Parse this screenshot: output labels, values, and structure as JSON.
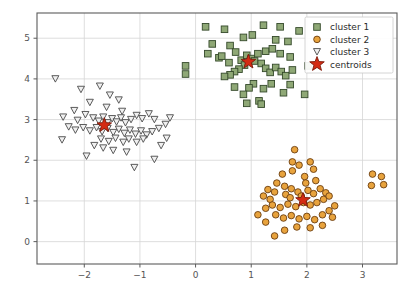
{
  "chart_data": {
    "type": "scatter",
    "title": "",
    "xlabel": "",
    "ylabel": "",
    "xlim": [
      -2.85,
      3.62
    ],
    "ylim": [
      -0.55,
      5.62
    ],
    "xticks": [
      -2,
      -1,
      0,
      1,
      2,
      3
    ],
    "yticks": [
      0,
      1,
      2,
      3,
      4,
      5
    ],
    "xticklabels": [
      "−2",
      "−1",
      "0",
      "1",
      "2",
      "3"
    ],
    "yticklabels": [
      "0",
      "1",
      "2",
      "3",
      "4",
      "5"
    ],
    "grid": true,
    "legend_position": "upper right",
    "colors": {
      "cluster1_fill": "#8fa876",
      "cluster1_edge": "#34492a",
      "cluster2_fill": "#e8a33d",
      "cluster2_edge": "#6b3d10",
      "cluster3_fill": "#f0f0f0",
      "cluster3_edge": "#4a4a4a",
      "centroid_fill": "#d42b13",
      "centroid_edge": "#7a1a0a",
      "grid": "#d6d6d6",
      "frame": "#5b5b5b",
      "background": "#ffffff"
    },
    "series": [
      {
        "name": "cluster 1",
        "marker": "square",
        "fill": "#8fa876",
        "edge": "#34492a",
        "points": [
          [
            -0.18,
            4.32
          ],
          [
            -0.18,
            4.12
          ],
          [
            0.18,
            5.28
          ],
          [
            0.52,
            5.22
          ],
          [
            0.3,
            4.86
          ],
          [
            0.62,
            4.82
          ],
          [
            0.86,
            5.02
          ],
          [
            1.02,
            5.08
          ],
          [
            1.22,
            5.32
          ],
          [
            1.52,
            5.28
          ],
          [
            1.86,
            5.18
          ],
          [
            1.66,
            4.92
          ],
          [
            0.22,
            4.62
          ],
          [
            0.42,
            4.52
          ],
          [
            0.47,
            4.56
          ],
          [
            0.6,
            4.4
          ],
          [
            0.72,
            4.66
          ],
          [
            0.82,
            4.46
          ],
          [
            0.92,
            4.58
          ],
          [
            1.0,
            4.5
          ],
          [
            1.06,
            4.44
          ],
          [
            1.12,
            4.62
          ],
          [
            1.18,
            4.38
          ],
          [
            0.88,
            4.34
          ],
          [
            0.78,
            4.24
          ],
          [
            0.7,
            4.18
          ],
          [
            0.62,
            4.1
          ],
          [
            0.52,
            4.06
          ],
          [
            1.26,
            4.26
          ],
          [
            1.34,
            4.16
          ],
          [
            1.44,
            4.28
          ],
          [
            1.54,
            4.18
          ],
          [
            1.62,
            4.08
          ],
          [
            1.74,
            4.22
          ],
          [
            1.26,
            4.68
          ],
          [
            1.38,
            4.74
          ],
          [
            1.52,
            4.62
          ],
          [
            1.7,
            4.54
          ],
          [
            1.44,
            4.96
          ],
          [
            1.04,
            3.88
          ],
          [
            0.96,
            3.78
          ],
          [
            0.7,
            3.8
          ],
          [
            0.86,
            3.62
          ],
          [
            1.22,
            3.76
          ],
          [
            1.36,
            3.88
          ],
          [
            1.58,
            3.66
          ],
          [
            2.02,
            4.32
          ],
          [
            1.96,
            3.62
          ],
          [
            0.92,
            3.4
          ],
          [
            1.14,
            3.46
          ],
          [
            1.18,
            3.38
          ],
          [
            1.7,
            3.86
          ]
        ]
      },
      {
        "name": "cluster 2",
        "marker": "circle",
        "fill": "#e8a33d",
        "edge": "#6b3d10",
        "points": [
          [
            1.56,
            1.66
          ],
          [
            1.74,
            1.74
          ],
          [
            1.96,
            1.6
          ],
          [
            2.12,
            1.78
          ],
          [
            1.46,
            1.44
          ],
          [
            1.6,
            1.36
          ],
          [
            1.3,
            1.28
          ],
          [
            1.42,
            1.22
          ],
          [
            1.22,
            1.12
          ],
          [
            1.34,
            1.04
          ],
          [
            1.62,
            1.16
          ],
          [
            1.72,
            1.3
          ],
          [
            1.84,
            1.22
          ],
          [
            1.9,
            1.12
          ],
          [
            2.02,
            1.26
          ],
          [
            2.12,
            1.18
          ],
          [
            2.24,
            1.3
          ],
          [
            2.34,
            1.2
          ],
          [
            2.3,
            1.04
          ],
          [
            2.4,
            1.12
          ],
          [
            2.18,
            0.96
          ],
          [
            2.06,
            0.9
          ],
          [
            1.94,
            0.96
          ],
          [
            1.8,
            0.86
          ],
          [
            1.66,
            0.92
          ],
          [
            1.52,
            0.84
          ],
          [
            1.38,
            0.9
          ],
          [
            1.26,
            0.82
          ],
          [
            1.44,
            0.66
          ],
          [
            1.58,
            0.58
          ],
          [
            1.72,
            0.64
          ],
          [
            1.86,
            0.56
          ],
          [
            2.0,
            0.62
          ],
          [
            2.14,
            0.54
          ],
          [
            2.28,
            0.66
          ],
          [
            2.4,
            0.76
          ],
          [
            2.5,
            0.88
          ],
          [
            2.46,
            0.6
          ],
          [
            2.28,
            0.4
          ],
          [
            2.06,
            0.34
          ],
          [
            1.82,
            0.36
          ],
          [
            1.6,
            0.28
          ],
          [
            1.42,
            0.14
          ],
          [
            1.26,
            0.48
          ],
          [
            1.12,
            0.66
          ],
          [
            1.7,
            1.08
          ],
          [
            1.98,
            1.44
          ],
          [
            2.16,
            1.5
          ],
          [
            1.86,
            1.88
          ],
          [
            2.06,
            1.96
          ],
          [
            1.74,
            1.96
          ],
          [
            3.18,
            1.66
          ],
          [
            3.34,
            1.6
          ],
          [
            3.16,
            1.38
          ],
          [
            3.38,
            1.4
          ],
          [
            1.78,
            2.26
          ]
        ]
      },
      {
        "name": "cluster 3",
        "marker": "triangle_down",
        "fill": "#f0f0f0",
        "edge": "#4a4a4a",
        "points": [
          [
            -2.52,
            4.0
          ],
          [
            -2.06,
            3.74
          ],
          [
            -1.72,
            3.82
          ],
          [
            -1.38,
            3.48
          ],
          [
            -1.9,
            3.42
          ],
          [
            -2.18,
            3.22
          ],
          [
            -1.6,
            3.3
          ],
          [
            -1.32,
            3.2
          ],
          [
            -2.38,
            3.06
          ],
          [
            -2.12,
            2.98
          ],
          [
            -1.98,
            3.12
          ],
          [
            -1.84,
            3.04
          ],
          [
            -1.74,
            2.96
          ],
          [
            -1.66,
            3.06
          ],
          [
            -1.58,
            2.92
          ],
          [
            -1.5,
            3.02
          ],
          [
            -1.42,
            2.94
          ],
          [
            -1.34,
            3.04
          ],
          [
            -1.26,
            2.92
          ],
          [
            -1.16,
            3.0
          ],
          [
            -1.06,
            3.1
          ],
          [
            -0.96,
            3.02
          ],
          [
            -0.84,
            3.14
          ],
          [
            -0.74,
            3.0
          ],
          [
            -2.28,
            2.82
          ],
          [
            -2.16,
            2.74
          ],
          [
            -2.02,
            2.8
          ],
          [
            -1.9,
            2.72
          ],
          [
            -1.78,
            2.8
          ],
          [
            -1.68,
            2.7
          ],
          [
            -1.58,
            2.78
          ],
          [
            -1.48,
            2.68
          ],
          [
            -1.38,
            2.76
          ],
          [
            -1.28,
            2.66
          ],
          [
            -1.18,
            2.74
          ],
          [
            -1.08,
            2.64
          ],
          [
            -0.98,
            2.72
          ],
          [
            -0.88,
            2.62
          ],
          [
            -0.78,
            2.7
          ],
          [
            -0.66,
            2.78
          ],
          [
            -0.54,
            2.88
          ],
          [
            -0.46,
            3.04
          ],
          [
            -1.7,
            2.52
          ],
          [
            -1.56,
            2.46
          ],
          [
            -1.44,
            2.54
          ],
          [
            -1.3,
            2.44
          ],
          [
            -1.2,
            2.52
          ],
          [
            -1.06,
            2.44
          ],
          [
            -0.94,
            2.52
          ],
          [
            -1.82,
            2.36
          ],
          [
            -1.66,
            2.3
          ],
          [
            -1.48,
            2.24
          ],
          [
            -1.24,
            2.2
          ],
          [
            -0.62,
            2.36
          ],
          [
            -0.74,
            2.02
          ],
          [
            -1.1,
            1.82
          ],
          [
            -1.96,
            2.1
          ],
          [
            -2.4,
            2.5
          ],
          [
            -0.52,
            2.54
          ],
          [
            -1.54,
            3.6
          ]
        ]
      },
      {
        "name": "centroids",
        "marker": "star",
        "fill": "#d42b13",
        "edge": "#7a1a0a",
        "points": [
          [
            0.95,
            4.42
          ],
          [
            1.93,
            1.02
          ],
          [
            -1.64,
            2.86
          ]
        ]
      }
    ],
    "legend_entries": [
      {
        "label": "cluster 1",
        "marker": "square",
        "fill": "#8fa876",
        "edge": "#34492a"
      },
      {
        "label": "cluster 2",
        "marker": "circle",
        "fill": "#e8a33d",
        "edge": "#6b3d10"
      },
      {
        "label": "cluster 3",
        "marker": "triangle_down",
        "fill": "#f0f0f0",
        "edge": "#4a4a4a"
      },
      {
        "label": "centroids",
        "marker": "star",
        "fill": "#d42b13",
        "edge": "#7a1a0a"
      }
    ]
  }
}
